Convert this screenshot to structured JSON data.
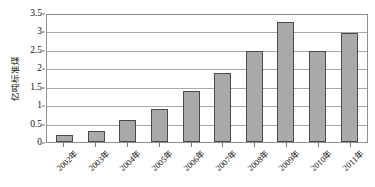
{
  "chart_data": {
    "type": "bar",
    "title": "",
    "xlabel": "",
    "ylabel": "亿吨标准煤",
    "categories": [
      "2002年",
      "2003年",
      "2004年",
      "2005年",
      "2006年",
      "2007年",
      "2008年",
      "2009年",
      "2010年",
      "2011年"
    ],
    "values": [
      0.2,
      0.3,
      0.6,
      0.9,
      1.4,
      1.9,
      2.5,
      3.3,
      2.5,
      3.0
    ],
    "ylim": [
      0,
      3.5
    ],
    "yticks": [
      "0",
      "0.5",
      "1",
      "1.5",
      "2",
      "2.5",
      "3",
      "3.5"
    ],
    "ytick_values": [
      0,
      0.5,
      1,
      1.5,
      2,
      2.5,
      3,
      3.5
    ],
    "grid": "horizontal",
    "legend": "none",
    "bar_color": "#a9a9a9",
    "bar_border_color": "#4a4a4a",
    "grid_color": "#a8a8a8",
    "axis_color": "#909090",
    "background": "#ffffff"
  }
}
